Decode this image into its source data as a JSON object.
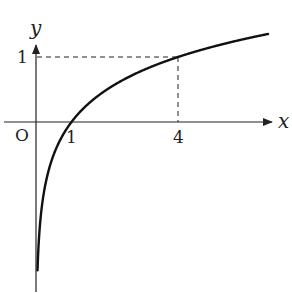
{
  "chart_data": {
    "type": "line",
    "title": "",
    "function": "y = log_4(x)",
    "xlabel": "x",
    "ylabel": "y",
    "origin_label": "O",
    "x_ticks": [
      {
        "value": 1,
        "label": "1"
      },
      {
        "value": 4,
        "label": "4"
      }
    ],
    "y_ticks": [
      {
        "value": 1,
        "label": "1"
      }
    ],
    "highlighted_point": {
      "x": 4,
      "y": 1
    },
    "guide_lines": "dashed from (0,1) to (4,1) and from (4,1) to (4,0)",
    "series": [
      {
        "name": "log curve",
        "x": [
          0.03,
          0.06,
          0.1,
          0.25,
          0.5,
          1,
          2,
          3,
          4,
          5,
          6,
          6.5
        ],
        "y": [
          -2.53,
          -2.03,
          -1.66,
          -1.0,
          -0.5,
          0,
          0.5,
          0.79,
          1,
          1.16,
          1.29,
          1.35
        ]
      }
    ],
    "xlim": [
      -0.9,
      6.8
    ],
    "ylim": [
      -2.6,
      1.2
    ],
    "grid": false,
    "legend": "none"
  },
  "colors": {
    "axis": "#222222",
    "curve": "#111111",
    "background": "#ffffff"
  }
}
